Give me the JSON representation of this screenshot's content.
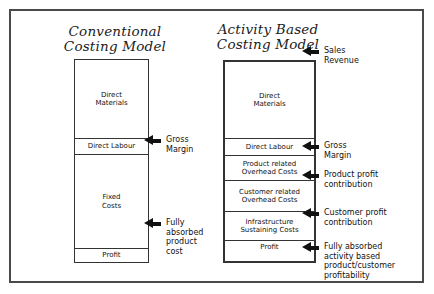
{
  "diagram": {
    "columns": [
      {
        "id": "conventional",
        "title": "Conventional\nCosting Model",
        "segments": [
          {
            "label": "Direct\nMaterials"
          },
          {
            "label": "Direct Labour"
          },
          {
            "label": "Fixed\nCosts"
          },
          {
            "label": "Profit"
          }
        ]
      },
      {
        "id": "activity-based",
        "title": "Activity Based\nCosting Model",
        "segments": [
          {
            "label": "Direct\nMaterials"
          },
          {
            "label": "Direct Labour"
          },
          {
            "label": "Product related\nOverhead Costs"
          },
          {
            "label": "Customer related\nOverhead Costs"
          },
          {
            "label": "Infrastructure\nSustaining Costs"
          },
          {
            "label": "Profit"
          }
        ]
      }
    ],
    "center_annotations": [
      {
        "id": "gross-margin",
        "text": "Gross\nMargin",
        "icon": "left-arrow-icon"
      },
      {
        "id": "fully-absorbed-product-cost",
        "text": "Fully\nabsorbed\nproduct\ncost",
        "icon": "left-arrow-icon"
      }
    ],
    "right_annotations": [
      {
        "id": "sales-revenue",
        "text": "Sales\nRevenue",
        "icon": "left-arrow-icon"
      },
      {
        "id": "gross-margin",
        "text": "Gross\nMargin",
        "icon": "left-arrow-icon"
      },
      {
        "id": "product-profit-contribution",
        "text": "Product profit\ncontribution",
        "icon": "left-arrow-icon"
      },
      {
        "id": "customer-profit-contribution",
        "text": "Customer profit\ncontribution",
        "icon": "left-arrow-icon"
      },
      {
        "id": "fully-absorbed-activity-based",
        "text": "Fully absorbed\nactivity based\nproduct/customer\nprofitability",
        "icon": "left-arrow-icon"
      }
    ]
  },
  "colors": {
    "frame": "#4a4a4a",
    "box_border": "#333333",
    "text": "#111111",
    "background": "#ffffff"
  }
}
